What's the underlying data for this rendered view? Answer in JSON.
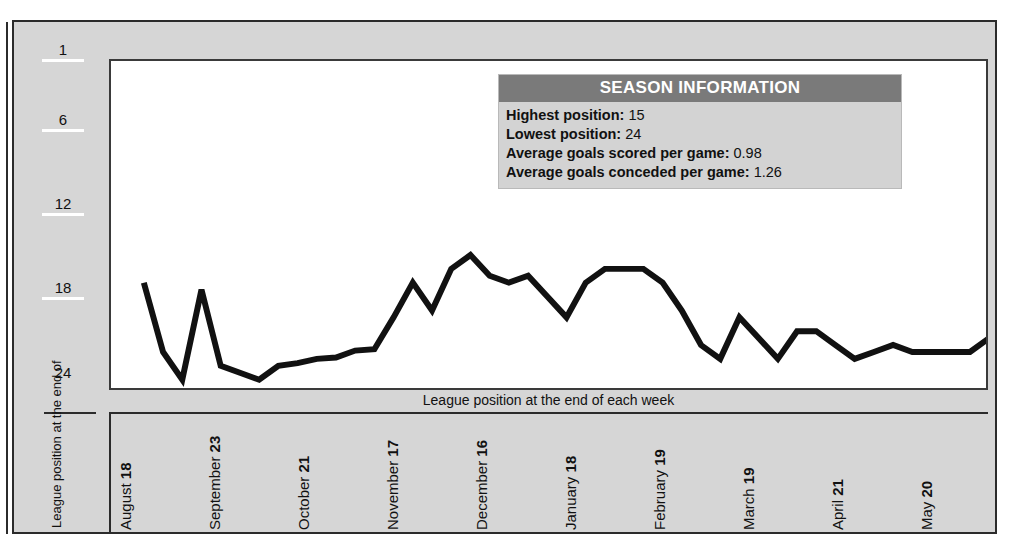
{
  "chart_data": {
    "type": "line",
    "title": "",
    "caption": "League position at the end of each week",
    "ylabel": "League position at the end of",
    "xlabel": "",
    "y_inverted": true,
    "ylim": [
      1,
      24.6
    ],
    "yticks": [
      1,
      6,
      12,
      18,
      24
    ],
    "grid": false,
    "legend": "none",
    "line_color": "#111111",
    "x_tick_labels": [
      {
        "month": "August",
        "day": "18"
      },
      {
        "month": "September",
        "day": "23"
      },
      {
        "month": "October",
        "day": "21"
      },
      {
        "month": "November",
        "day": "17"
      },
      {
        "month": "December",
        "day": "16"
      },
      {
        "month": "January",
        "day": "18"
      },
      {
        "month": "February",
        "day": "19"
      },
      {
        "month": "March",
        "day": "19"
      },
      {
        "month": "April",
        "day": "21"
      },
      {
        "month": "May",
        "day": "20"
      }
    ],
    "series": [
      {
        "name": "League position",
        "values": [
          17,
          22,
          24,
          17.5,
          23,
          23.5,
          24,
          23,
          22.8,
          22.5,
          22.4,
          21.9,
          21.8,
          19.5,
          17,
          19,
          16,
          15,
          16.5,
          17,
          16.5,
          18,
          19.5,
          17,
          16,
          16,
          16,
          17,
          19,
          21.5,
          22.5,
          19.5,
          21,
          22.5,
          20.5,
          20.5,
          21.5,
          22.5,
          22,
          21.5,
          22,
          22,
          22,
          22,
          21
        ]
      }
    ]
  },
  "info_box": {
    "title": "SEASON INFORMATION",
    "rows": [
      {
        "label": "Highest position:",
        "value": "15"
      },
      {
        "label": "Lowest position:",
        "value": "24"
      },
      {
        "label": "Average goals scored per game:",
        "value": "0.98"
      },
      {
        "label": "Average goals conceded per game:",
        "value": "1.26"
      }
    ]
  },
  "colors": {
    "panel_bg": "#d6d6d6",
    "plot_bg": "#ffffff",
    "border": "#2b2b2b",
    "info_header_bg": "#7a7a7a",
    "info_body_bg": "#d3d3d3",
    "line": "#111111"
  }
}
